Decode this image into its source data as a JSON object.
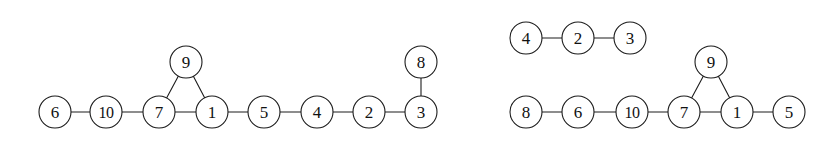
{
  "figure": {
    "background_color": "#ffffff",
    "stroke_color": "#1c1c1c",
    "label_color": "#111111",
    "node_radius": 16,
    "node_fill": "#ffffff"
  },
  "chart_data": {
    "type": "diagram",
    "subtype": "node-link-graph",
    "title": "",
    "xlabel": "",
    "ylabel": "",
    "panels": [
      {
        "name": "left-graph",
        "components": 1,
        "nodes": [
          {
            "id": "6",
            "label": "6",
            "x": 55,
            "y": 112
          },
          {
            "id": "10",
            "label": "10",
            "x": 106,
            "y": 112
          },
          {
            "id": "7",
            "label": "7",
            "x": 159,
            "y": 112
          },
          {
            "id": "9",
            "label": "9",
            "x": 186,
            "y": 62
          },
          {
            "id": "1",
            "label": "1",
            "x": 212,
            "y": 112
          },
          {
            "id": "5",
            "label": "5",
            "x": 264,
            "y": 112
          },
          {
            "id": "4",
            "label": "4",
            "x": 317,
            "y": 112
          },
          {
            "id": "2",
            "label": "2",
            "x": 369,
            "y": 112
          },
          {
            "id": "3",
            "label": "3",
            "x": 421,
            "y": 112
          },
          {
            "id": "8",
            "label": "8",
            "x": 421,
            "y": 62
          }
        ],
        "edges": [
          {
            "source": "6",
            "target": "10"
          },
          {
            "source": "10",
            "target": "7"
          },
          {
            "source": "7",
            "target": "9"
          },
          {
            "source": "7",
            "target": "1"
          },
          {
            "source": "9",
            "target": "1"
          },
          {
            "source": "1",
            "target": "5"
          },
          {
            "source": "5",
            "target": "4"
          },
          {
            "source": "4",
            "target": "2"
          },
          {
            "source": "2",
            "target": "3"
          },
          {
            "source": "3",
            "target": "8"
          }
        ]
      },
      {
        "name": "right-graph",
        "components": 2,
        "nodes": [
          {
            "id": "r4",
            "label": "4",
            "x": 526,
            "y": 38
          },
          {
            "id": "r2",
            "label": "2",
            "x": 578,
            "y": 38
          },
          {
            "id": "r3",
            "label": "3",
            "x": 630,
            "y": 38
          },
          {
            "id": "r8",
            "label": "8",
            "x": 526,
            "y": 112
          },
          {
            "id": "r6",
            "label": "6",
            "x": 578,
            "y": 112
          },
          {
            "id": "r10",
            "label": "10",
            "x": 632,
            "y": 112
          },
          {
            "id": "r7",
            "label": "7",
            "x": 684,
            "y": 112
          },
          {
            "id": "r9",
            "label": "9",
            "x": 711,
            "y": 62
          },
          {
            "id": "r1",
            "label": "1",
            "x": 737,
            "y": 112
          },
          {
            "id": "r5",
            "label": "5",
            "x": 789,
            "y": 112
          }
        ],
        "edges": [
          {
            "source": "r4",
            "target": "r2"
          },
          {
            "source": "r2",
            "target": "r3"
          },
          {
            "source": "r8",
            "target": "r6"
          },
          {
            "source": "r6",
            "target": "r10"
          },
          {
            "source": "r10",
            "target": "r7"
          },
          {
            "source": "r7",
            "target": "r9"
          },
          {
            "source": "r7",
            "target": "r1"
          },
          {
            "source": "r9",
            "target": "r1"
          },
          {
            "source": "r1",
            "target": "r5"
          }
        ]
      }
    ]
  }
}
